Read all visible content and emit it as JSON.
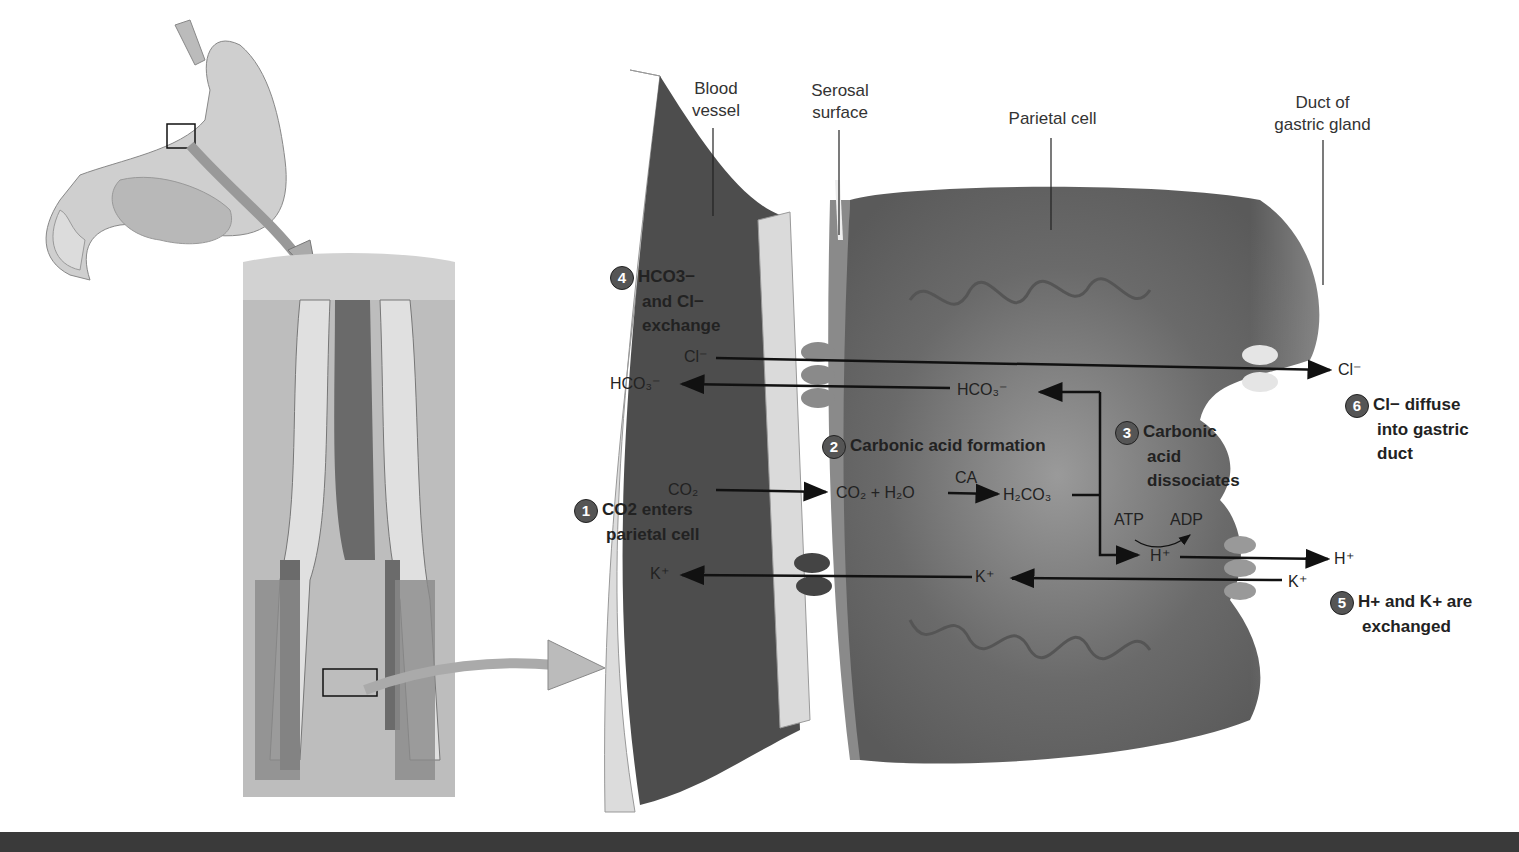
{
  "labels": {
    "blood_vessel": [
      "Blood",
      "vessel"
    ],
    "serosal_surface": [
      "Serosal",
      "surface"
    ],
    "parietal_cell": "Parietal cell",
    "duct": [
      "Duct of",
      "gastric gland"
    ]
  },
  "steps": [
    {
      "num": "1",
      "lines": [
        "CO2 enters",
        "parietal cell"
      ]
    },
    {
      "num": "2",
      "lines": [
        "Carbonic acid formation"
      ]
    },
    {
      "num": "3",
      "lines": [
        "Carbonic",
        "acid",
        "dissociates"
      ]
    },
    {
      "num": "4",
      "lines": [
        "HCO3−",
        "and Cl−",
        "exchange"
      ]
    },
    {
      "num": "5",
      "lines": [
        "H+ and K+ are",
        "exchanged"
      ]
    },
    {
      "num": "6",
      "lines": [
        "Cl− diffuse",
        "into gastric",
        "duct"
      ]
    }
  ],
  "chem": {
    "cl_left": "Cl⁻",
    "cl_right": "Cl⁻",
    "hco3_left": "HCO₃⁻",
    "hco3_mid": "HCO₃⁻",
    "co2_left": "CO₂",
    "reaction": "CO₂ + H₂O",
    "ca": "CA",
    "h2co3": "H₂CO₃",
    "atp": "ATP",
    "adp": "ADP",
    "h_mid": "H⁺",
    "h_right": "H⁺",
    "k_left": "K⁺",
    "k_mid": "K⁺",
    "k_right": "K⁺"
  },
  "colors": {
    "vessel_dark": "#4a4a4a",
    "vessel_light": "#d8d8d8",
    "cell": "#6e6e6e",
    "step_circle": "#555555"
  }
}
